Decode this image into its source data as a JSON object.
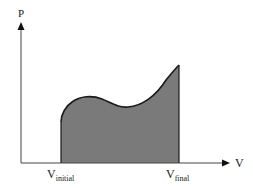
{
  "diagram": {
    "type": "pv-diagram",
    "y_axis": {
      "label": "P"
    },
    "x_axis": {
      "label": "V"
    },
    "markers": [
      {
        "main": "V",
        "sub": "initial"
      },
      {
        "main": "V",
        "sub": "final"
      }
    ],
    "shaded_region": {
      "description": "Area under the P–V curve between V_initial and V_final (work done)"
    },
    "colors": {
      "fill": "#7a7a7a",
      "curve": "#1a1a1a",
      "axis": "#444444",
      "background": "#ffffff"
    }
  }
}
